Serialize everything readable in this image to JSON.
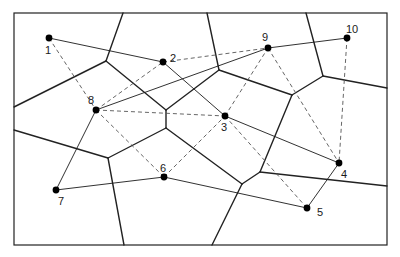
{
  "diagram": {
    "type": "voronoi-with-delaunay-and-tour",
    "frame": {
      "x1": 14,
      "y1": 13,
      "x2": 387,
      "y2": 245
    },
    "colors": {
      "stroke": "#1a1a1a",
      "voronoi": "#222222",
      "dashed": "#555555",
      "background": "#ffffff"
    },
    "sites": [
      {
        "id": "1",
        "label": "1",
        "x": 49,
        "y": 38,
        "lx": 45,
        "ly": 54
      },
      {
        "id": "2",
        "label": "2",
        "x": 163,
        "y": 62,
        "lx": 170,
        "ly": 62
      },
      {
        "id": "3",
        "label": "3",
        "x": 225,
        "y": 116,
        "lx": 221,
        "ly": 131
      },
      {
        "id": "4",
        "label": "4",
        "x": 339,
        "y": 163,
        "lx": 341,
        "ly": 178
      },
      {
        "id": "5",
        "label": "5",
        "x": 307,
        "y": 208,
        "lx": 317,
        "ly": 216
      },
      {
        "id": "6",
        "label": "6",
        "x": 164,
        "y": 177,
        "lx": 160,
        "ly": 172
      },
      {
        "id": "7",
        "label": "7",
        "x": 56,
        "y": 190,
        "lx": 58,
        "ly": 205
      },
      {
        "id": "8",
        "label": "8",
        "x": 96,
        "y": 110,
        "lx": 88,
        "ly": 104
      },
      {
        "id": "9",
        "label": "9",
        "x": 268,
        "y": 48,
        "lx": 262,
        "ly": 41
      },
      {
        "id": "10",
        "label": "10",
        "x": 347,
        "y": 38,
        "lx": 346,
        "ly": 33
      }
    ],
    "tour_edges": [
      [
        "1",
        "2"
      ],
      [
        "2",
        "3"
      ],
      [
        "3",
        "4"
      ],
      [
        "4",
        "5"
      ],
      [
        "5",
        "6"
      ],
      [
        "6",
        "7"
      ],
      [
        "7",
        "8"
      ],
      [
        "8",
        "9"
      ],
      [
        "9",
        "10"
      ]
    ],
    "dashed_edges": [
      [
        "1",
        "8"
      ],
      [
        "8",
        "2"
      ],
      [
        "2",
        "9"
      ],
      [
        "8",
        "3"
      ],
      [
        "8",
        "6"
      ],
      [
        "6",
        "3"
      ],
      [
        "3",
        "9"
      ],
      [
        "9",
        "4"
      ],
      [
        "10",
        "4"
      ],
      [
        "3",
        "5"
      ]
    ],
    "voronoi_edges": [
      [
        [
          123,
          13
        ],
        [
          106,
          61
        ]
      ],
      [
        [
          106,
          61
        ],
        [
          14,
          107
        ]
      ],
      [
        [
          106,
          61
        ],
        [
          166,
          110
        ]
      ],
      [
        [
          166,
          110
        ],
        [
          219,
          70
        ]
      ],
      [
        [
          219,
          70
        ],
        [
          207,
          13
        ]
      ],
      [
        [
          219,
          70
        ],
        [
          292,
          95
        ]
      ],
      [
        [
          292,
          95
        ],
        [
          323,
          76
        ]
      ],
      [
        [
          323,
          76
        ],
        [
          306,
          13
        ]
      ],
      [
        [
          323,
          76
        ],
        [
          387,
          88
        ]
      ],
      [
        [
          292,
          95
        ],
        [
          260,
          172
        ]
      ],
      [
        [
          260,
          172
        ],
        [
          242,
          184
        ]
      ],
      [
        [
          260,
          172
        ],
        [
          387,
          186
        ]
      ],
      [
        [
          242,
          184
        ],
        [
          212,
          245
        ]
      ],
      [
        [
          242,
          184
        ],
        [
          166,
          128
        ]
      ],
      [
        [
          166,
          110
        ],
        [
          166,
          128
        ]
      ],
      [
        [
          166,
          128
        ],
        [
          108,
          158
        ]
      ],
      [
        [
          108,
          158
        ],
        [
          14,
          130
        ]
      ],
      [
        [
          108,
          158
        ],
        [
          124,
          245
        ]
      ]
    ]
  }
}
